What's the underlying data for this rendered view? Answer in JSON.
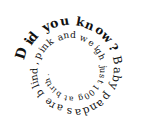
{
  "spiral_text": {
    "headline": "Did you know?",
    "body": "Baby pandas are blind, pink and weigh just 100g at birth.",
    "full": "Did you know? Baby pandas are blind, pink and weigh just 100g at birth.",
    "text_color": "#111111",
    "background": "#ffffff"
  }
}
